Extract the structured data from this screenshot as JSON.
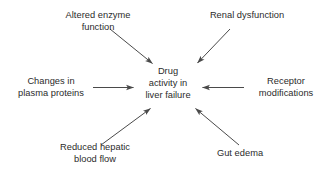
{
  "diagram": {
    "type": "radial-influence-diagram",
    "background_color": "#ffffff",
    "text_color": "#2b2b2b",
    "arrow_color": "#4a4a4a",
    "center": {
      "id": "drug-activity-in-liver-failure",
      "lines": [
        "Drug",
        "activity in",
        "liver failure"
      ],
      "full_text": "Drug activity in liver failure"
    },
    "factors": [
      {
        "id": "altered-enzyme-function",
        "lines": [
          "Altered enzyme",
          "function"
        ],
        "full_text": "Altered enzyme function",
        "position": "top-left",
        "arrow": {
          "direction": "to-center",
          "style": "diagonal-down-right"
        }
      },
      {
        "id": "renal-dysfunction",
        "lines": [
          "Renal dysfunction"
        ],
        "full_text": "Renal dysfunction",
        "position": "top-right",
        "arrow": {
          "direction": "to-center",
          "style": "diagonal-down-left"
        }
      },
      {
        "id": "changes-in-plasma-proteins",
        "lines": [
          "Changes in",
          "plasma proteins"
        ],
        "full_text": "Changes in plasma proteins",
        "position": "left",
        "arrow": {
          "direction": "to-center",
          "style": "horizontal-right"
        }
      },
      {
        "id": "receptor-modifications",
        "lines": [
          "Receptor",
          "modifications"
        ],
        "full_text": "Receptor modifications",
        "position": "right",
        "arrow": {
          "direction": "to-center",
          "style": "horizontal-left"
        }
      },
      {
        "id": "reduced-hepatic-blood-flow",
        "lines": [
          "Reduced hepatic",
          "blood flow"
        ],
        "full_text": "Reduced hepatic blood flow",
        "position": "bottom-left",
        "arrow": {
          "direction": "to-center",
          "style": "diagonal-up-right"
        }
      },
      {
        "id": "gut-edema",
        "lines": [
          "Gut edema"
        ],
        "full_text": "Gut edema",
        "position": "bottom-right",
        "arrow": {
          "direction": "to-center",
          "style": "diagonal-up-left"
        }
      }
    ]
  }
}
